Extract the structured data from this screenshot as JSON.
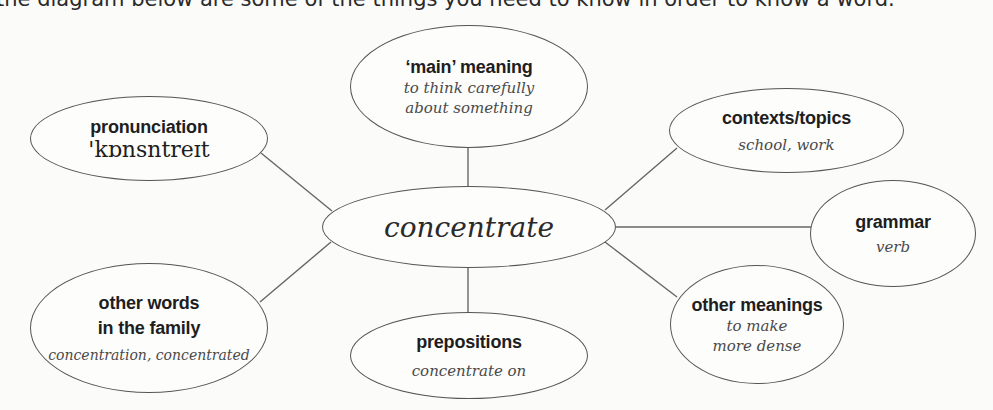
{
  "intro_text": "the diagram below are some of the things you need to know in order to know a word.",
  "center": {
    "word": "concentrate"
  },
  "nodes": {
    "main_meaning": {
      "label": "‘main’ meaning",
      "value_lines": [
        "to think carefully",
        "about something"
      ]
    },
    "pronunciation": {
      "label": "pronunciation",
      "value": "'kɒnsntreɪt"
    },
    "contexts": {
      "label": "contexts/topics",
      "value": "school, work"
    },
    "grammar": {
      "label": "grammar",
      "value": "verb"
    },
    "family": {
      "label_lines": [
        "other words",
        "in the family"
      ],
      "value": "concentration, concentrated"
    },
    "prepositions": {
      "label": "prepositions",
      "value": "concentrate on"
    },
    "other_meanings": {
      "label": "other meanings",
      "value_lines": [
        "to make",
        "more dense"
      ]
    }
  },
  "colors": {
    "stroke": "#555555",
    "background": "#fbfbfa",
    "label_text": "#1e1e1e",
    "value_text": "#4a4a4a"
  }
}
